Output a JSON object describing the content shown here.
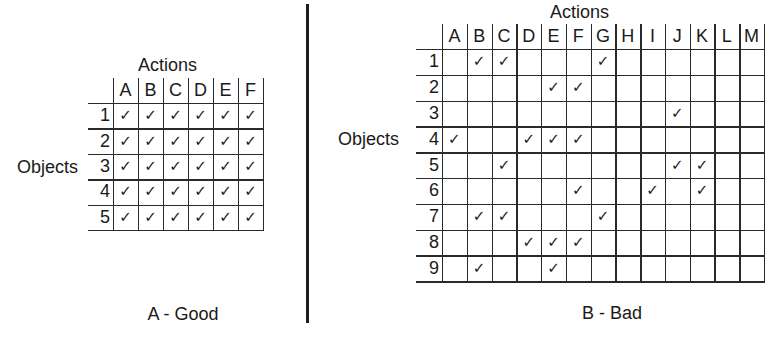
{
  "figure": {
    "divider": true,
    "panels": [
      {
        "id": "A",
        "caption": "A - Good",
        "actions_label": "Actions",
        "objects_label": "Objects",
        "columns": [
          "A",
          "B",
          "C",
          "D",
          "E",
          "F"
        ],
        "rows": [
          "1",
          "2",
          "3",
          "4",
          "5"
        ],
        "checks": {
          "1": [
            "A",
            "B",
            "C",
            "D",
            "E",
            "F"
          ],
          "2": [
            "A",
            "B",
            "C",
            "D",
            "E",
            "F"
          ],
          "3": [
            "A",
            "B",
            "C",
            "D",
            "E",
            "F"
          ],
          "4": [
            "A",
            "B",
            "C",
            "D",
            "E",
            "F"
          ],
          "5": [
            "A",
            "B",
            "C",
            "D",
            "E",
            "F"
          ]
        },
        "layout": {
          "grid_left": 113,
          "header_top": 78,
          "header_bottom": 103,
          "col_width": 25,
          "row_height": 25.4,
          "rowhdr_left": 88,
          "actions_x": 138,
          "actions_y": 55,
          "objects_x": 17,
          "objects_row_index": 2,
          "caption_cx": 183,
          "caption_y": 304
        }
      },
      {
        "id": "B",
        "caption": "B - Bad",
        "actions_label": "Actions",
        "objects_label": "Objects",
        "columns": [
          "A",
          "B",
          "C",
          "D",
          "E",
          "F",
          "G",
          "H",
          "I",
          "J",
          "K",
          "L",
          "M"
        ],
        "rows": [
          "1",
          "2",
          "3",
          "4",
          "5",
          "6",
          "7",
          "8",
          "9"
        ],
        "checks": {
          "1": [
            "B",
            "C",
            "G"
          ],
          "2": [
            "E",
            "F"
          ],
          "3": [
            "J"
          ],
          "4": [
            "A",
            "D",
            "E",
            "F"
          ],
          "5": [
            "C",
            "J",
            "K"
          ],
          "6": [
            "F",
            "I",
            "K"
          ],
          "7": [
            "B",
            "C",
            "G"
          ],
          "8": [
            "D",
            "E",
            "F"
          ],
          "9": [
            "B",
            "E"
          ]
        },
        "layout": {
          "grid_left": 442,
          "header_top": 24,
          "header_bottom": 49,
          "col_width": 24.77,
          "row_height": 25.8,
          "rowhdr_left": 416,
          "actions_x": 550,
          "actions_y": 2,
          "objects_x": 338,
          "objects_row_index": 3,
          "caption_cx": 612,
          "caption_y": 303
        }
      }
    ],
    "check_glyph": "✓",
    "line_color": "#2a2a2a",
    "text_color": "#1a1a1a"
  }
}
